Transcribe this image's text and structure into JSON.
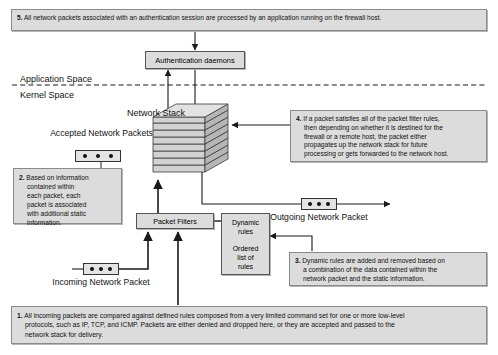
{
  "diagram": {
    "spaces": {
      "application": "Application Space",
      "kernel": "Kernel Space"
    },
    "labels": {
      "network_stack": "Network Stack",
      "accepted_packets_line1": "Accepted Network",
      "accepted_packets_line2": "Packets",
      "outgoing_packet_line1": "Outgoing Network",
      "outgoing_packet_line2": "Packet",
      "incoming_packet_line1": "Incoming Network",
      "incoming_packet_line2": "Packet"
    },
    "boxes": {
      "auth_daemons": "Authentication daemons",
      "packet_filters": "Packet Filters",
      "dynamic_rules_line1": "Dynamic",
      "dynamic_rules_line2": "rules",
      "ordered_list_line1": "Ordered",
      "ordered_list_line2": "list of",
      "ordered_list_line3": "rules"
    },
    "notes": [
      {
        "id": "note-1",
        "num": "1.",
        "lines": [
          "All incoming packets are compared against defined rules composed from a very limited command set for one or more low-level",
          "protocols, such as IP, TCP, and ICMP. Packets are either denied and dropped here, or they are accepted and passed to the",
          "network stack for delivery."
        ]
      },
      {
        "id": "note-2",
        "num": "2.",
        "lines": [
          "Based on information",
          "contained within",
          "each packet, each",
          "packet is associated",
          "with additional static",
          "information."
        ]
      },
      {
        "id": "note-3",
        "num": "3.",
        "lines": [
          "Dynamic rules are added and removed based on",
          "a combination of the data contained within the",
          "network packet and the static information."
        ]
      },
      {
        "id": "note-4",
        "num": "4.",
        "lines": [
          "If a packet satisfies all of the packet filter rules,",
          "then depending on whether it is destined for the",
          "firewall or a remote host, the packet either",
          "propagates up the network stack for future",
          "processing or gets forwarded to the network host."
        ]
      },
      {
        "id": "note-5",
        "num": "5.",
        "lines": [
          "All network packets associated with an authentication session are processed by an application running on the firewall host."
        ]
      }
    ],
    "colors": {
      "box_fill": "#dcdcdc",
      "box_border": "#8a8a8a",
      "line": "#222222",
      "stack_fill": "#d2d2d2"
    }
  }
}
